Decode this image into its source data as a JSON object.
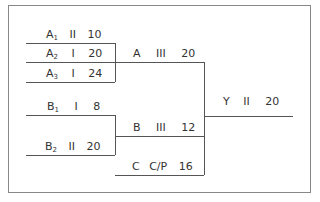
{
  "diagram": {
    "nodes": [
      {
        "id": "A1",
        "name": "A",
        "sub": "1",
        "grade": "II",
        "value": "10"
      },
      {
        "id": "A2",
        "name": "A",
        "sub": "2",
        "grade": "I",
        "value": "20"
      },
      {
        "id": "A3",
        "name": "A",
        "sub": "3",
        "grade": "I",
        "value": "24"
      },
      {
        "id": "B1",
        "name": "B",
        "sub": "1",
        "grade": "I",
        "value": "8"
      },
      {
        "id": "B2",
        "name": "B",
        "sub": "2",
        "grade": "II",
        "value": "20"
      },
      {
        "id": "A",
        "name": "A",
        "sub": "",
        "grade": "III",
        "value": "20"
      },
      {
        "id": "B",
        "name": "B",
        "sub": "",
        "grade": "III",
        "value": "12"
      },
      {
        "id": "C",
        "name": "C",
        "sub": "",
        "grade": "C/P",
        "value": "16"
      },
      {
        "id": "Y",
        "name": "Y",
        "sub": "",
        "grade": "II",
        "value": "20"
      }
    ],
    "edges": [
      {
        "from": "A1",
        "to": "A"
      },
      {
        "from": "A2",
        "to": "A"
      },
      {
        "from": "A3",
        "to": "A"
      },
      {
        "from": "B1",
        "to": "B"
      },
      {
        "from": "B2",
        "to": "B"
      },
      {
        "from": "A",
        "to": "Y"
      },
      {
        "from": "B",
        "to": "Y"
      },
      {
        "from": "C",
        "to": "Y"
      }
    ]
  }
}
